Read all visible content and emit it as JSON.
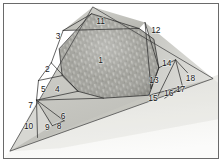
{
  "figure": {
    "caption_text": "",
    "frame_border_color": "#6a6a6a",
    "background_color": "#ffffff",
    "line_color": "#2b2b2b",
    "label_color": "#1a1a1a",
    "texture_fill_color": "#9a9a94",
    "plane_fill_color": "#c9c9c4",
    "ground_fill_color": "#efefec"
  },
  "regions": [
    {
      "id": "1",
      "label": "1",
      "x": 101,
      "y": 61,
      "kind": "textured-core"
    },
    {
      "id": "2",
      "label": "2",
      "x": 47,
      "y": 70,
      "kind": "facet"
    },
    {
      "id": "3",
      "label": "3",
      "x": 58,
      "y": 36,
      "kind": "facet"
    },
    {
      "id": "4",
      "label": "4",
      "x": 57,
      "y": 90,
      "kind": "facet"
    },
    {
      "id": "5",
      "label": "5",
      "x": 43,
      "y": 90,
      "kind": "facet"
    },
    {
      "id": "6",
      "label": "6",
      "x": 63,
      "y": 118,
      "kind": "facet"
    },
    {
      "id": "7",
      "label": "7",
      "x": 30,
      "y": 107,
      "kind": "facet"
    },
    {
      "id": "8",
      "label": "8",
      "x": 59,
      "y": 128,
      "kind": "facet"
    },
    {
      "id": "9",
      "label": "9",
      "x": 47,
      "y": 129,
      "kind": "facet"
    },
    {
      "id": "10",
      "label": "10",
      "x": 28,
      "y": 128,
      "kind": "facet"
    },
    {
      "id": "11",
      "label": "11",
      "x": 101,
      "y": 21,
      "kind": "facet"
    },
    {
      "id": "12",
      "label": "12",
      "x": 157,
      "y": 30,
      "kind": "facet"
    },
    {
      "id": "13",
      "label": "13",
      "x": 155,
      "y": 81,
      "kind": "facet"
    },
    {
      "id": "14",
      "label": "14",
      "x": 168,
      "y": 64,
      "kind": "facet"
    },
    {
      "id": "15",
      "label": "15",
      "x": 154,
      "y": 100,
      "kind": "facet"
    },
    {
      "id": "16",
      "label": "16",
      "x": 170,
      "y": 95,
      "kind": "facet"
    },
    {
      "id": "17",
      "label": "17",
      "x": 182,
      "y": 90,
      "kind": "facet"
    },
    {
      "id": "18",
      "label": "18",
      "x": 192,
      "y": 79,
      "kind": "facet"
    }
  ],
  "geometry": {
    "outer_triangle": "93,6 215,79 9,153",
    "ground_edge": "9,153 215,79",
    "core_polygon": "92,13 140,28 155,39 160,68 150,96 104,99 78,92 62,76 59,49",
    "segments": [
      "63,30 140,28",
      "63,30 92,13",
      "63,30 51,63",
      "51,63 78,92",
      "51,63 38,81",
      "38,81 62,76",
      "38,81 37,101",
      "37,101 78,92",
      "37,101 104,99",
      "37,101 62,121",
      "37,101 50,126",
      "50,126 62,121",
      "37,101 37,138",
      "146,22 152,88",
      "152,88 160,68",
      "146,22 160,68",
      "160,68 176,60",
      "176,60 160,97",
      "176,60 183,86",
      "183,86 165,99",
      "176,60 188,72",
      "150,96 183,86"
    ]
  }
}
